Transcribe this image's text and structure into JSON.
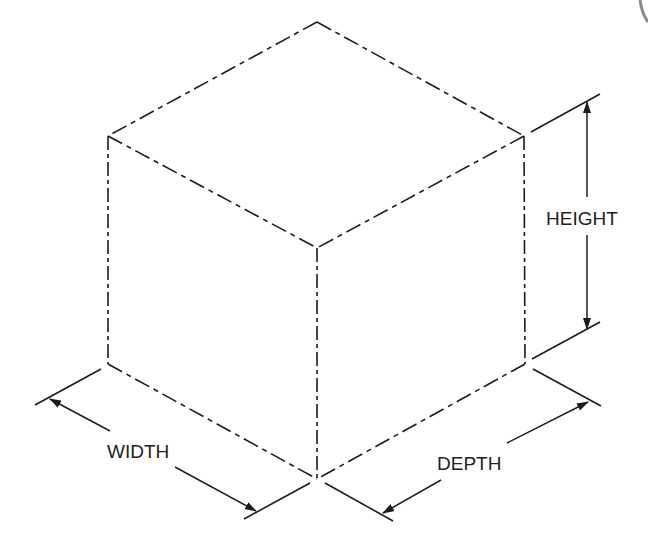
{
  "diagram": {
    "type": "isometric dimensioned cube",
    "line_color": "#1c1c1c",
    "background": "#ffffff",
    "labels": {
      "height": "HEIGHT",
      "width": "WIDTH",
      "depth": "DEPTH"
    },
    "vertices": {
      "top": [
        317,
        22
      ],
      "left_top": [
        108,
        136
      ],
      "right_top": [
        524,
        136
      ],
      "front_top": [
        317,
        248
      ],
      "left_bottom": [
        108,
        364
      ],
      "front_bottom": [
        317,
        479
      ],
      "right_bottom": [
        525,
        364
      ]
    }
  }
}
